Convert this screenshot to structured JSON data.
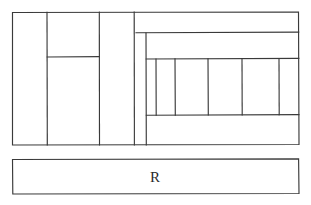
{
  "diagram": {
    "title": "",
    "stroke_color": "#3a3a3a",
    "fill_color": "#ffffff",
    "canvas": {
      "width": 311,
      "height": 205
    },
    "labels": [
      {
        "id": "bottom-bar-label",
        "text": "R",
        "x": 155,
        "y": 179
      }
    ],
    "shapes": {
      "main_rect": {
        "x": 12,
        "y": 12,
        "width": 287,
        "height": 133
      },
      "bottom_bar": {
        "x": 12,
        "y": 159,
        "width": 287,
        "height": 35
      },
      "left_column_a": {
        "x": 12,
        "y": 12,
        "width": 35,
        "height": 133
      },
      "left_column_b_top": {
        "x": 47,
        "y": 12,
        "width": 52,
        "height": 45
      },
      "left_column_b_bottom": {
        "x": 47,
        "y": 57,
        "width": 52,
        "height": 88
      },
      "left_column_c": {
        "x": 99,
        "y": 12,
        "width": 35,
        "height": 133
      },
      "left_column_d": {
        "x": 134,
        "y": 12,
        "width": 12,
        "height": 133
      },
      "right_band_top": {
        "x": 146,
        "y": 12,
        "width": 153,
        "height": 21
      },
      "right_band_mid": {
        "x": 146,
        "y": 33,
        "width": 153,
        "height": 26
      },
      "right_band_bottom": {
        "x": 146,
        "y": 115,
        "width": 153,
        "height": 30
      },
      "right_cells_row": {
        "x": 146,
        "y": 59,
        "width": 153,
        "height": 56
      }
    },
    "sub_cells": {
      "count": 5,
      "y_top": 59,
      "y_bottom": 115,
      "x_edges": [
        146,
        156,
        175,
        208,
        242,
        279,
        299
      ]
    }
  }
}
